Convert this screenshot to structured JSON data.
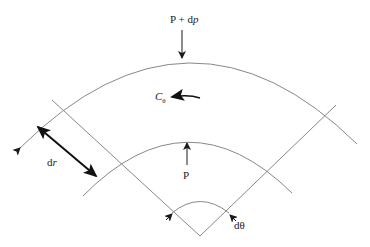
{
  "diagram": {
    "labels": {
      "outer_pressure": "P + dp",
      "outer_pressure_base": "P + d",
      "outer_pressure_italic": "p",
      "inner_pressure": "P",
      "moment": "C",
      "moment_sub": "θ",
      "radial_increment": "d",
      "radial_increment_italic": "r",
      "angle_increment": "dθ"
    },
    "colors": {
      "line": "#888888",
      "arrow": "#1a1a1a",
      "text": "#222222"
    }
  }
}
